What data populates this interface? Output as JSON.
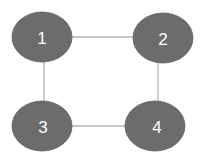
{
  "diagram": {
    "type": "undirected-graph",
    "nodes": [
      {
        "id": "1",
        "label": "1"
      },
      {
        "id": "2",
        "label": "2"
      },
      {
        "id": "3",
        "label": "3"
      },
      {
        "id": "4",
        "label": "4"
      }
    ],
    "edges": [
      {
        "from": "1",
        "to": "2"
      },
      {
        "from": "1",
        "to": "3"
      },
      {
        "from": "2",
        "to": "4"
      },
      {
        "from": "3",
        "to": "4"
      }
    ],
    "colors": {
      "node_fill": "#6c6c6c",
      "edge": "#b4b4b4",
      "label": "#ffffff"
    }
  }
}
